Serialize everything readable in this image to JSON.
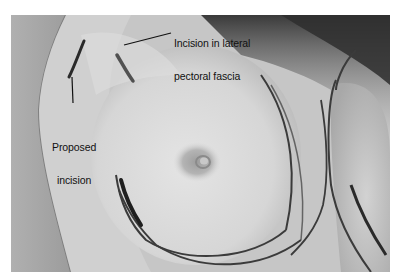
{
  "figure": {
    "type": "clinical-photograph",
    "color_mode": "grayscale",
    "annotations": [
      {
        "id": "fascia",
        "text_lines": [
          "Incision in lateral",
          "pectoral fascia"
        ]
      },
      {
        "id": "proposed",
        "text_lines": [
          "Proposed",
          "incision"
        ]
      }
    ]
  },
  "labels": {
    "fascia_line1": "Incision in lateral",
    "fascia_line2": "pectoral fascia",
    "proposed_line1": "Proposed",
    "proposed_line2": "incision"
  },
  "colors": {
    "page_background": "#ffffff",
    "skin_light": "#dcdcdc",
    "skin_mid": "#bdbdbd",
    "drape": "#a9a9a9",
    "marker_ink": "#2a2a2a",
    "label_text": "#111111"
  }
}
